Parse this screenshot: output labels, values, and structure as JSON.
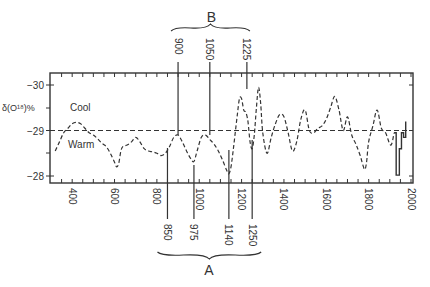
{
  "chart_data": {
    "type": "line",
    "title": "",
    "xlabel": "",
    "ylabel": "δ(O¹⁸)%",
    "xlim": [
      300,
      2000
    ],
    "ylim": [
      -27.8,
      -30.25
    ],
    "y_inverted": true,
    "grid": false,
    "x_ticks": [
      400,
      600,
      800,
      1000,
      1200,
      1400,
      1600,
      1800,
      2000
    ],
    "y_ticks": [
      -30,
      -29,
      -28
    ],
    "y_tick_labels": [
      "−30",
      "−29",
      "−28"
    ],
    "reference_line": {
      "y": -29,
      "style": "dashed"
    },
    "annotations": {
      "cool": "Cool",
      "warm": "Warm"
    },
    "series": [
      {
        "name": "proxy record (dashed)",
        "style": "dashed",
        "x": [
          320,
          340,
          360,
          380,
          400,
          420,
          440,
          460,
          480,
          500,
          520,
          540,
          560,
          580,
          600,
          610,
          620,
          630,
          640,
          660,
          680,
          700,
          720,
          740,
          760,
          780,
          800,
          820,
          840,
          860,
          880,
          900,
          920,
          940,
          960,
          975,
          990,
          1010,
          1030,
          1050,
          1070,
          1090,
          1110,
          1130,
          1140,
          1150,
          1160,
          1170,
          1180,
          1190,
          1200,
          1210,
          1220,
          1230,
          1240,
          1250,
          1260,
          1270,
          1280,
          1290,
          1300,
          1320,
          1340,
          1360,
          1380,
          1400,
          1420,
          1440,
          1460,
          1480,
          1500,
          1520,
          1540,
          1560,
          1580,
          1600,
          1620,
          1640,
          1660,
          1680,
          1700,
          1720,
          1740,
          1760,
          1780,
          1790,
          1800,
          1820,
          1840,
          1860,
          1880,
          1900,
          1910,
          1920
        ],
        "y": [
          -28.55,
          -28.75,
          -28.95,
          -29.05,
          -29.15,
          -29.18,
          -29.15,
          -29.05,
          -28.95,
          -28.9,
          -28.82,
          -28.72,
          -28.65,
          -28.5,
          -28.3,
          -28.2,
          -28.28,
          -28.55,
          -28.65,
          -28.68,
          -28.75,
          -28.85,
          -28.75,
          -28.6,
          -28.55,
          -28.53,
          -28.5,
          -28.45,
          -28.5,
          -28.65,
          -28.85,
          -28.9,
          -28.75,
          -28.55,
          -28.38,
          -28.32,
          -28.55,
          -28.85,
          -28.9,
          -28.8,
          -28.7,
          -28.55,
          -28.35,
          -28.12,
          -28.05,
          -28.2,
          -28.55,
          -28.95,
          -29.35,
          -29.7,
          -29.7,
          -29.45,
          -29.4,
          -29.2,
          -28.75,
          -28.6,
          -28.9,
          -29.5,
          -29.95,
          -29.6,
          -28.95,
          -28.5,
          -28.85,
          -29.15,
          -29.35,
          -29.3,
          -28.95,
          -28.55,
          -28.75,
          -29.25,
          -29.45,
          -29.0,
          -28.95,
          -29.05,
          -29.1,
          -29.25,
          -29.5,
          -29.75,
          -29.45,
          -29.0,
          -29.3,
          -28.9,
          -28.7,
          -28.45,
          -28.15,
          -28.3,
          -28.75,
          -29.1,
          -29.45,
          -29.05,
          -28.95,
          -28.7,
          -28.72,
          -28.95
        ]
      },
      {
        "name": "instrumental (solid)",
        "style": "solid",
        "x": [
          1920,
          1930,
          1930,
          1945,
          1945,
          1955,
          1955,
          1965,
          1965,
          1975,
          1975
        ],
        "y": [
          -28.95,
          -28.95,
          -28.02,
          -28.02,
          -28.6,
          -28.6,
          -28.95,
          -28.95,
          -28.85,
          -28.85,
          -29.2
        ]
      }
    ],
    "groups": [
      {
        "label": "B",
        "position": "top",
        "years": [
          900,
          1050,
          1225
        ]
      },
      {
        "label": "A",
        "position": "bottom",
        "years": [
          850,
          975,
          1140,
          1250
        ]
      }
    ]
  }
}
